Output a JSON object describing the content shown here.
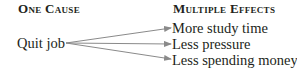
{
  "headers": {
    "cause": "One Cause",
    "effects": "Multiple Effects"
  },
  "cause": "Quit job",
  "effects": [
    "More study time",
    "Less pressure",
    "Less spending money"
  ],
  "colors": {
    "text": "#231f20",
    "arrow": "#8a8a8a"
  }
}
